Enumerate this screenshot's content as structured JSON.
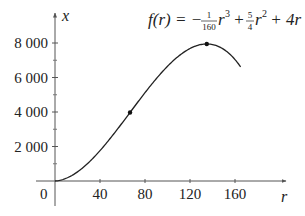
{
  "chart_data": {
    "type": "line",
    "title": "",
    "formula": {
      "lhs": "f(r) = −",
      "frac1_num": "1",
      "frac1_den": "160",
      "term1": "r",
      "exp1": "3",
      "plus1": " + ",
      "frac2_num": "5",
      "frac2_den": "4",
      "term2": "r",
      "exp2": "2",
      "tail": " + 4r"
    },
    "xlabel": "r",
    "ylabel": "x",
    "origin_label": "0",
    "xlim": [
      0,
      185
    ],
    "ylim": [
      0,
      9200
    ],
    "x_ticks": [
      40,
      80,
      120,
      160
    ],
    "x_tick_labels": [
      "40",
      "80",
      "120",
      "160"
    ],
    "y_ticks": [
      2000,
      4000,
      6000,
      8000
    ],
    "y_tick_labels": [
      "2 000",
      "4 000",
      "6 000",
      "8 000"
    ],
    "y_minor_ticks": [
      1000,
      3000,
      5000,
      7000
    ],
    "grid": false,
    "series": [
      {
        "name": "f(r) = -r^3/160 + 5r^2/4 + 4r",
        "x": [
          0,
          10,
          20,
          30,
          40,
          50,
          60,
          66.7,
          70,
          80,
          90,
          100,
          110,
          120,
          130,
          134.9,
          140,
          150,
          160,
          165
        ],
        "values": [
          0,
          159,
          610,
          1333,
          2160,
          3146,
          4170,
          3970,
          4424,
          5400,
          6240,
          7150,
          7611,
          7680,
          7726,
          7941,
          7910,
          7613,
          7040,
          6617
        ]
      }
    ],
    "marked_points": [
      {
        "label": "inflection point",
        "r": 66.7,
        "value": 3970
      },
      {
        "label": "maximum",
        "r": 134.9,
        "value": 7941
      }
    ]
  }
}
